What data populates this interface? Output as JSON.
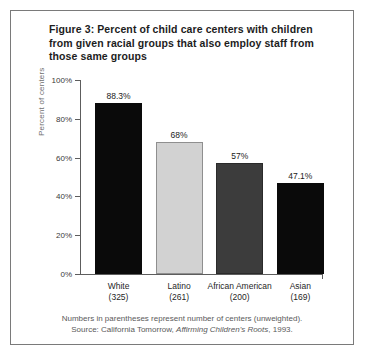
{
  "figure": {
    "title": "Figure 3: Percent of child care centers with children from given racial groups that also employ staff from those same groups",
    "footnote_line1": "Numbers in parentheses represent number of centers (unweighted).",
    "source_prefix": "Source: California Tomorrow, ",
    "source_italic": "Affirming Children's Roots",
    "source_suffix": ", 1993."
  },
  "chart_data": {
    "type": "bar",
    "title": "Figure 3: Percent of child care centers with children from given racial groups that also employ staff from those same groups",
    "xlabel": "",
    "ylabel": "Percent of centers",
    "ylim": [
      0,
      100
    ],
    "yticks": [
      "0%",
      "20%",
      "40%",
      "60%",
      "80%",
      "100%"
    ],
    "ytick_values": [
      0,
      20,
      40,
      60,
      80,
      100
    ],
    "grid": false,
    "legend": "none",
    "categories": [
      "White",
      "Latino",
      "African American",
      "Asian"
    ],
    "category_counts": [
      "(325)",
      "(261)",
      "(200)",
      "(169)"
    ],
    "values": [
      88.3,
      68,
      57,
      47.1
    ],
    "value_labels": [
      "88.3%",
      "68%",
      "57%",
      "47.1%"
    ],
    "bar_colors": [
      "#0a0a0a",
      "#d2d2d2",
      "#3c3c3c",
      "#0a0a0a"
    ],
    "bar_edge_colors": [
      "#0a0a0a",
      "#8f8f8f",
      "#2a2a2a",
      "#0a0a0a"
    ]
  },
  "colors": {
    "frame_border": "#7a7a7a",
    "axis": "#5d5d5d",
    "text": "#1a1a1a",
    "muted_text": "#5a5a5a"
  }
}
